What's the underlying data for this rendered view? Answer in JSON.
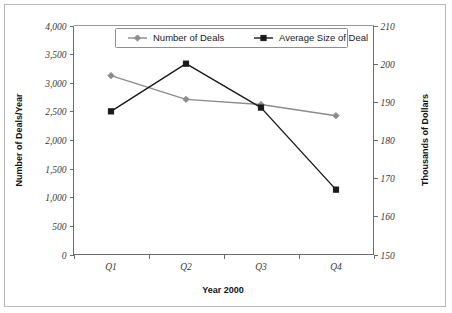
{
  "chart_data": {
    "type": "line",
    "title": "",
    "xlabel": "Year 2000",
    "ylabel": "Number of Deals/Year",
    "y2label": "Thousands of Dollars",
    "categories": [
      "Q1",
      "Q2",
      "Q3",
      "Q4"
    ],
    "ylim": [
      0,
      4000
    ],
    "y2lim": [
      150,
      210
    ],
    "yticks": [
      "0",
      "500",
      "1,000",
      "1,500",
      "2,000",
      "2,500",
      "3,000",
      "3,500",
      "4,000"
    ],
    "ytick_values": [
      0,
      500,
      1000,
      1500,
      2000,
      2500,
      3000,
      3500,
      4000
    ],
    "y2ticks": [
      "150",
      "160",
      "170",
      "180",
      "190",
      "200",
      "210"
    ],
    "y2tick_values": [
      150,
      160,
      170,
      180,
      190,
      200,
      210
    ],
    "grid": false,
    "legend_position": "top-center",
    "series": [
      {
        "name": "Number of Deals",
        "axis": "left",
        "marker": "diamond",
        "color": "#8c8c8c",
        "values": [
          3125,
          2710,
          2620,
          2425
        ]
      },
      {
        "name": "Average Size of Deal",
        "axis": "right",
        "marker": "square",
        "color": "#1a1a1a",
        "values": [
          187.5,
          200.0,
          188.5,
          167.0
        ]
      }
    ]
  },
  "legend": {
    "items": [
      {
        "label": "Number of Deals",
        "marker": "diamond",
        "color": "#8c8c8c"
      },
      {
        "label": "Average Size of Deal",
        "marker": "square",
        "color": "#1a1a1a"
      }
    ]
  },
  "axes": {
    "x_title": "Year 2000",
    "y_title": "Number of Deals/Year",
    "y2_title": "Thousands of Dollars"
  },
  "colors": {
    "series_1": "#8c8c8c",
    "series_2": "#1a1a1a",
    "axis": "#6b6b6b",
    "border": "#b9b9b9",
    "background": "#ffffff"
  }
}
